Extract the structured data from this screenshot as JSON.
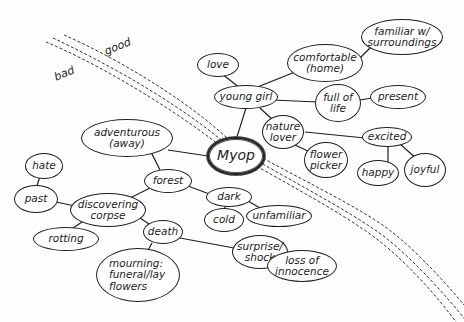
{
  "diagram": {
    "type": "mind-map",
    "colors": {
      "ink": "#1e1e1e",
      "background": "#fefefe"
    },
    "divider": {
      "style": "dashed triple line",
      "side_labels": {
        "upper": "good",
        "lower": "bad"
      }
    },
    "center": {
      "id": "myop",
      "label": "Myop"
    },
    "nodes": {
      "love": "love",
      "young_girl": "young girl",
      "comfortable": "comfortable\n(home)",
      "familiar": "familiar w/\nsurroundings",
      "full_of_life": "full of\nlife",
      "present": "present",
      "nature_lover": "nature\nlover",
      "excited": "excited",
      "flower_picker": "flower\npicker",
      "happy": "happy",
      "joyful": "joyful",
      "adventurous": "adventurous\n(away)",
      "hate": "hate",
      "forest": "forest",
      "past": "past",
      "discovering_corpse": "discovering\ncorpse",
      "dark": "dark",
      "cold": "cold",
      "unfamiliar": "unfamiliar",
      "rotting": "rotting",
      "death": "death",
      "surprise": "surprise/\nshock",
      "loss": "loss of\ninnocence",
      "mourning": "mourning:\nfuneral/lay\nflowers"
    },
    "edges": [
      [
        "myop",
        "young_girl"
      ],
      [
        "young_girl",
        "love"
      ],
      [
        "young_girl",
        "comfortable"
      ],
      [
        "comfortable",
        "familiar"
      ],
      [
        "young_girl",
        "full_of_life"
      ],
      [
        "full_of_life",
        "present"
      ],
      [
        "young_girl",
        "nature_lover"
      ],
      [
        "nature_lover",
        "excited"
      ],
      [
        "nature_lover",
        "flower_picker"
      ],
      [
        "excited",
        "happy"
      ],
      [
        "excited",
        "joyful"
      ],
      [
        "myop",
        "adventurous"
      ],
      [
        "adventurous",
        "forest"
      ],
      [
        "forest",
        "discovering_corpse"
      ],
      [
        "forest",
        "dark"
      ],
      [
        "dark",
        "cold"
      ],
      [
        "dark",
        "unfamiliar"
      ],
      [
        "discovering_corpse",
        "past"
      ],
      [
        "past",
        "hate"
      ],
      [
        "discovering_corpse",
        "rotting"
      ],
      [
        "discovering_corpse",
        "death"
      ],
      [
        "death",
        "mourning"
      ],
      [
        "death",
        "surprise"
      ],
      [
        "surprise",
        "loss"
      ]
    ]
  }
}
